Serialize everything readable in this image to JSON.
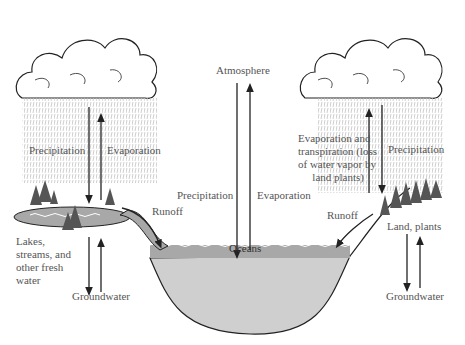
{
  "labels": {
    "left_precipitation": "Precipitation",
    "left_evaporation": "Evaporation",
    "atmosphere": "Atmosphere",
    "center_precipitation": "Precipitation",
    "center_evaporation": "Evaporation",
    "right_evap_transpiration": [
      "Evaporation and",
      "transpiration (loss",
      "of water vapor by",
      "land plants)"
    ],
    "right_precipitation": "Precipitation",
    "left_runoff": "Runoff",
    "right_runoff": "Runoff",
    "oceans": "Oceans",
    "lakes": [
      "Lakes,",
      "streams, and",
      "other  fresh",
      "water"
    ],
    "land_plants": "Land, plants",
    "left_groundwater": "Groundwater",
    "right_groundwater": "Groundwater"
  },
  "colors": {
    "line": "#222222",
    "water_surface": "#a8a8a8",
    "water_deep": "#cfcfcf",
    "text": "#555555"
  }
}
